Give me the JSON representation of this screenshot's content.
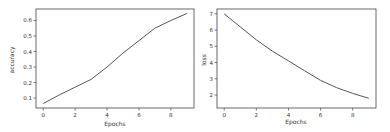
{
  "chart_data": [
    {
      "type": "line",
      "title": "",
      "xlabel": "Epochs",
      "ylabel": "accuracy",
      "x": [
        0,
        1,
        2,
        3,
        4,
        5,
        6,
        7,
        8,
        9
      ],
      "series": [
        {
          "name": "accuracy",
          "values": [
            0.065,
            0.12,
            0.17,
            0.22,
            0.3,
            0.39,
            0.47,
            0.55,
            0.6,
            0.645
          ],
          "color": "#555555"
        }
      ],
      "xticks": [
        0,
        2,
        4,
        6,
        8
      ],
      "yticks": [
        0.1,
        0.2,
        0.3,
        0.4,
        0.5,
        0.6
      ],
      "xlim": [
        -0.45,
        9.45
      ],
      "ylim": [
        0.036,
        0.674
      ],
      "grid": false,
      "legend": null
    },
    {
      "type": "line",
      "title": "",
      "xlabel": "Epochs",
      "ylabel": "loss",
      "x": [
        0,
        1,
        2,
        3,
        4,
        5,
        6,
        7,
        8,
        9
      ],
      "series": [
        {
          "name": "loss",
          "values": [
            7.0,
            6.2,
            5.4,
            4.7,
            4.1,
            3.5,
            2.9,
            2.45,
            2.1,
            1.8
          ],
          "color": "#555555"
        }
      ],
      "xticks": [
        0,
        2,
        4,
        6,
        8
      ],
      "yticks": [
        2,
        3,
        4,
        5,
        6,
        7
      ],
      "xlim": [
        -0.45,
        9.45
      ],
      "ylim": [
        1.2,
        7.3
      ],
      "grid": false,
      "legend": null
    }
  ],
  "charts": {
    "left": {
      "xlabel": "Epochs",
      "ylabel": "accuracy",
      "xtick_labels": [
        "0",
        "2",
        "4",
        "6",
        "8"
      ],
      "ytick_labels": [
        "0.1",
        "0.2",
        "0.3",
        "0.4",
        "0.5",
        "0.6"
      ]
    },
    "right": {
      "xlabel": "Epochs",
      "ylabel": "loss",
      "xtick_labels": [
        "0",
        "2",
        "4",
        "6",
        "8"
      ],
      "ytick_labels": [
        "2",
        "3",
        "4",
        "5",
        "6",
        "7"
      ]
    }
  }
}
